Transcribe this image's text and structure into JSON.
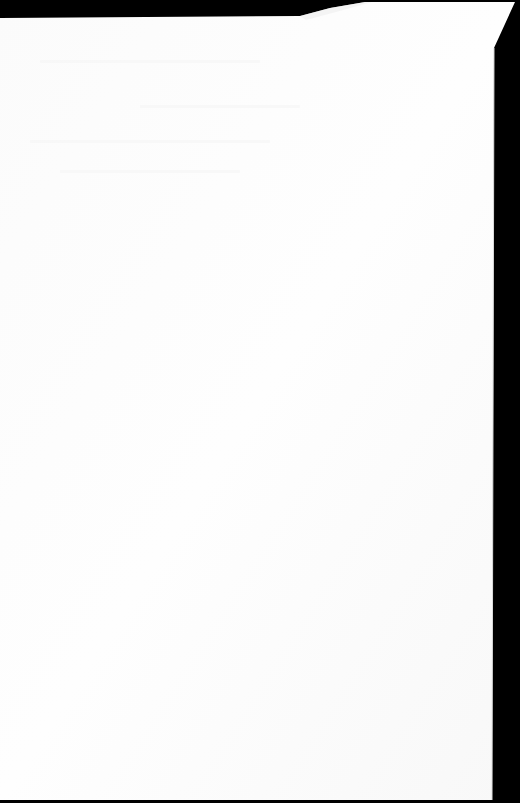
{
  "scene": {
    "description": "Photo of a blank white sheet of paper on a black background",
    "background_color": "#000000",
    "paper_color": "#fdfdfd",
    "paper_shade_color": "#f6f6f6",
    "paper_outline": [
      [
        0,
        18
      ],
      [
        300,
        16
      ],
      [
        330,
        8
      ],
      [
        365,
        2
      ],
      [
        515,
        2
      ],
      [
        494,
        48
      ],
      [
        492,
        800
      ],
      [
        0,
        800
      ]
    ],
    "text_content": ""
  }
}
